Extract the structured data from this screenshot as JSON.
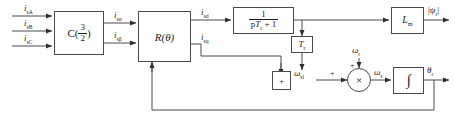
{
  "diagram": {
    "background": "#ffffff",
    "line_color": "#4a4a4a",
    "text_color": "#1a1a1a",
    "width": 455,
    "height": 127
  },
  "inputs": [
    {
      "name": "phase-a-current",
      "label": "i",
      "sub": "sA"
    },
    {
      "name": "phase-b-current",
      "label": "i",
      "sub": "sB"
    },
    {
      "name": "phase-c-current",
      "label": "i",
      "sub": "sC"
    }
  ],
  "blocks": {
    "clarke": {
      "label": "C(",
      "fraction_num": "3",
      "fraction_den": "2",
      "label_close": ")"
    },
    "park": {
      "label": "R(θ)"
    },
    "lag": {
      "fraction_num": "1",
      "fraction_den_p": "p",
      "fraction_den_T": "T",
      "fraction_den_sub": "r",
      "fraction_den_tail": " + 1"
    },
    "magnetizing": {
      "label": "L",
      "sub": "m"
    },
    "rotor_time_const": {
      "label": "T",
      "sub": "r"
    },
    "slip_sum": {
      "sign": "+"
    },
    "speed_sum": {
      "symbol": "×"
    },
    "integrator": {
      "label": "∫"
    }
  },
  "signals": {
    "i_s_alpha": {
      "label": "i",
      "sub": "sα"
    },
    "i_s_beta": {
      "label": "i",
      "sub": "sβ"
    },
    "i_sd": {
      "label": "i",
      "sub": "sd"
    },
    "i_sq": {
      "label": "i",
      "sub": "sq"
    },
    "flux_magnitude": {
      "label": "|ψ",
      "sub": "r",
      "tail": "|"
    },
    "omega_sl": {
      "label": "ω",
      "sub": "sl"
    },
    "omega_r": {
      "label": "ω",
      "sub": "r"
    },
    "omega_s": {
      "label": "ω",
      "sub": "s"
    },
    "theta_r": {
      "label": "θ",
      "sub": "r"
    }
  },
  "signs": {
    "slip_sum_plus": "+",
    "speed_sum_left_plus": "+",
    "speed_sum_top_plus": "+"
  }
}
